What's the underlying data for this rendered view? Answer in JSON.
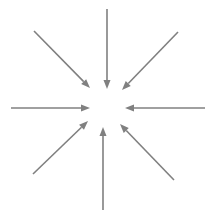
{
  "diagram": {
    "name": "converging-arrows-diagram",
    "type": "radial-convergence",
    "background_color": "#ffffff",
    "arrow_color": "#808080",
    "stroke_width": 1.6,
    "head_length": 9,
    "head_width": 7,
    "center": {
      "x": 107,
      "y": 108
    },
    "inner_gap_radius": 19,
    "arrows": [
      {
        "id": "arrow-north",
        "label": "north",
        "direction": "down",
        "angle_deg": 270,
        "tail": {
          "x": 107,
          "y": 9
        },
        "tip": {
          "x": 107,
          "y": 89
        }
      },
      {
        "id": "arrow-northeast",
        "label": "northeast",
        "direction": "down-left",
        "angle_deg": 225,
        "tail": {
          "x": 178,
          "y": 32
        },
        "tip": {
          "x": 122,
          "y": 90
        }
      },
      {
        "id": "arrow-east",
        "label": "east",
        "direction": "left",
        "angle_deg": 180,
        "tail": {
          "x": 205,
          "y": 108
        },
        "tip": {
          "x": 125,
          "y": 108
        }
      },
      {
        "id": "arrow-southeast",
        "label": "southeast",
        "direction": "up-left",
        "angle_deg": 135,
        "tail": {
          "x": 174,
          "y": 180
        },
        "tip": {
          "x": 120,
          "y": 124
        }
      },
      {
        "id": "arrow-south",
        "label": "south",
        "direction": "up",
        "angle_deg": 90,
        "tail": {
          "x": 103,
          "y": 210
        },
        "tip": {
          "x": 103,
          "y": 127
        }
      },
      {
        "id": "arrow-southwest",
        "label": "southwest",
        "direction": "up-right",
        "angle_deg": 45,
        "tail": {
          "x": 33,
          "y": 174
        },
        "tip": {
          "x": 88,
          "y": 121
        }
      },
      {
        "id": "arrow-west",
        "label": "west",
        "direction": "right",
        "angle_deg": 0,
        "tail": {
          "x": 11,
          "y": 108
        },
        "tip": {
          "x": 90,
          "y": 108
        }
      },
      {
        "id": "arrow-northwest",
        "label": "northwest",
        "direction": "down-right",
        "angle_deg": 315,
        "tail": {
          "x": 34,
          "y": 31
        },
        "tip": {
          "x": 90,
          "y": 88
        }
      }
    ]
  }
}
